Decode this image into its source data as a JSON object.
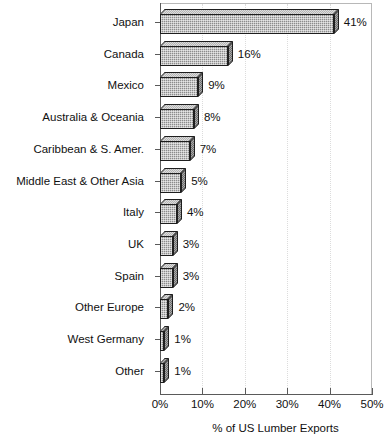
{
  "chart_data": {
    "type": "bar",
    "orientation": "horizontal",
    "title": "",
    "xlabel": "% of US Lumber Exports",
    "ylabel": "",
    "xlim": [
      0,
      50
    ],
    "grid": true,
    "legend": "none",
    "xticks": [
      "0%",
      "10%",
      "20%",
      "30%",
      "40%",
      "50%"
    ],
    "xtick_values": [
      0,
      10,
      20,
      30,
      40,
      50
    ],
    "categories": [
      "Japan",
      "Canada",
      "Mexico",
      "Australia & Oceania",
      "Caribbean & S. Amer.",
      "Middle East & Other Asia",
      "Italy",
      "UK",
      "Spain",
      "Other Europe",
      "West Germany",
      "Other"
    ],
    "values": [
      41,
      16,
      9,
      8,
      7,
      5,
      4,
      3,
      3,
      2,
      1,
      1
    ],
    "data_labels": [
      "41%",
      "16%",
      "9%",
      "8%",
      "7%",
      "5%",
      "4%",
      "3%",
      "3%",
      "2%",
      "1%",
      "1%"
    ],
    "series": [
      {
        "name": "% of US Lumber Exports",
        "values": [
          41,
          16,
          9,
          8,
          7,
          5,
          4,
          3,
          3,
          2,
          1,
          1
        ]
      }
    ]
  },
  "colors": {
    "bar_front": "#8c8c8c",
    "bar_top": "#b4b4b4",
    "bar_side": "#6e6e6e",
    "bar_outline": "#1e1e1e",
    "axis": "#5a5a5a",
    "grid": "#dcdcdc",
    "text": "#111111",
    "background": "#ffffff"
  }
}
